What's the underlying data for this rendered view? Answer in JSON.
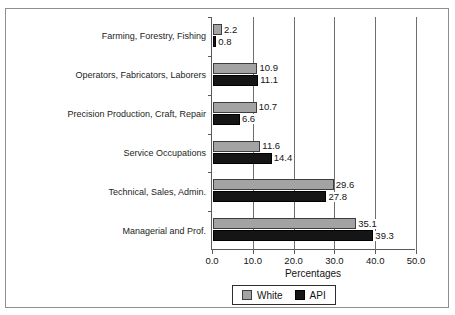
{
  "chart_data": {
    "type": "bar",
    "orientation": "horizontal",
    "title": "",
    "xlabel": "Percentages",
    "ylabel": "",
    "xlim": [
      0.0,
      50.0
    ],
    "xticks": [
      "0.0",
      "10.0",
      "20.0",
      "30.0",
      "40.0",
      "50.0"
    ],
    "xtick_values": [
      0.0,
      10.0,
      20.0,
      30.0,
      40.0,
      50.0
    ],
    "grid": true,
    "grid_axis": "x",
    "legend_position": "bottom-center",
    "categories": [
      "Farming, Forestry, Fishing",
      "Operators, Fabricators, Laborers",
      "Precision Production, Craft, Repair",
      "Service Occupations",
      "Technical, Sales, Admin.",
      "Managerial and Prof."
    ],
    "series": [
      {
        "name": "White",
        "color": "#a3a3a3",
        "values": [
          2.2,
          10.9,
          10.7,
          11.6,
          29.6,
          35.1
        ],
        "labels": [
          "2.2",
          "10.9",
          "10.7",
          "11.6",
          "29.6",
          "35.1"
        ]
      },
      {
        "name": "API",
        "color": "#151515",
        "values": [
          0.8,
          11.1,
          6.6,
          14.4,
          27.8,
          39.3
        ],
        "labels": [
          "0.8",
          "11.1",
          "6.6",
          "14.4",
          "27.8",
          "39.3"
        ]
      }
    ]
  },
  "legend": {
    "entries": [
      {
        "label": "White",
        "color": "#a3a3a3"
      },
      {
        "label": "API",
        "color": "#151515"
      }
    ]
  },
  "axis": {
    "x_title": "Percentages"
  }
}
